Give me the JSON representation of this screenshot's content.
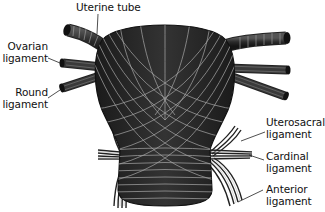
{
  "diagram": {
    "colors": {
      "body_fill": "#2a2a2a",
      "fiber_stroke": "#a9a9a9",
      "leader_line": "#222222",
      "label_text": "#111111",
      "background": "#ffffff"
    },
    "labels": {
      "uterine_tube": "Uterine tube",
      "ovarian_ligament_1": "Ovarian",
      "ovarian_ligament_2": "ligament",
      "round_ligament_1": "Round",
      "round_ligament_2": "ligament",
      "uterosacral_ligament_1": "Uterosacral",
      "uterosacral_ligament_2": "ligament",
      "cardinal_ligament_1": "Cardinal",
      "cardinal_ligament_2": "ligament",
      "anterior_ligament_1": "Anterior",
      "anterior_ligament_2": "ligament"
    }
  }
}
